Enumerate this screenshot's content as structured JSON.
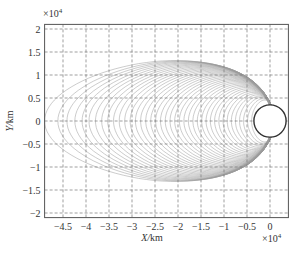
{
  "chart_data": {
    "type": "line",
    "title": "",
    "xlabel": "X/km",
    "ylabel": "Y/km",
    "x_exponent_label": "×10^4",
    "y_exponent_label": "×10^4",
    "xlim": [
      -4.9,
      0.4
    ],
    "ylim": [
      -2.1,
      2.1
    ],
    "x_ticks": [
      -4.5,
      -4,
      -3.5,
      -3,
      -2.5,
      -2,
      -1.5,
      -1,
      -0.5,
      0
    ],
    "x_tick_labels": [
      "−4.5",
      "−4",
      "−3.5",
      "−3",
      "−2.5",
      "−2",
      "−1.5",
      "−1",
      "−0.5",
      "0"
    ],
    "y_ticks": [
      2,
      1.5,
      1,
      0.5,
      0,
      -0.5,
      -1,
      -1.5,
      -2
    ],
    "y_tick_labels": [
      "2",
      "1.5",
      "1",
      "0.5",
      "0",
      "−0.5",
      "−1",
      "−1.5",
      "−2"
    ],
    "grid": true,
    "grid_style": "dashed",
    "legend": null,
    "central_body": {
      "center": [
        0,
        0
      ],
      "radius": 0.35,
      "units": "×10^4 km"
    },
    "series": {
      "name": "trajectory family (closed orbits around central body)",
      "count": 40,
      "left_extent_range": [
        -4.9,
        -0.4
      ],
      "max_half_height_range": [
        0.45,
        1.3
      ],
      "right_convergence_x": 0.0,
      "line_color": "#9a9a9a"
    }
  },
  "colors": {
    "frame": "#555555",
    "grid": "#777777",
    "curve": "#9a9a9a",
    "body": "#333333"
  }
}
